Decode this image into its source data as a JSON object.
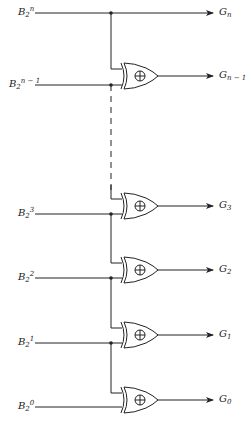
{
  "diagram": {
    "type": "binary-to-gray-code-converter",
    "line_color": "#222222",
    "inputs": [
      {
        "base": "B",
        "sub": "2",
        "sup": "n",
        "y": 13
      },
      {
        "base": "B",
        "sub": "2",
        "sup": "n − 1",
        "y": 85
      },
      {
        "base": "B",
        "sub": "2",
        "sup": "3",
        "y": 214
      },
      {
        "base": "B",
        "sub": "2",
        "sup": "2",
        "y": 278
      },
      {
        "base": "B",
        "sub": "2",
        "sup": "1",
        "y": 343
      },
      {
        "base": "B",
        "sub": "2",
        "sup": "0",
        "y": 407
      }
    ],
    "outputs": [
      {
        "base": "G",
        "sub": "n",
        "y": 13
      },
      {
        "base": "G",
        "sub": "n − 1",
        "y": 76
      },
      {
        "base": "G",
        "sub": "3",
        "y": 206
      },
      {
        "base": "G",
        "sub": "2",
        "y": 270
      },
      {
        "base": "G",
        "sub": "1",
        "y": 335
      },
      {
        "base": "G",
        "sub": "0",
        "y": 400
      }
    ],
    "gate_symbol": "⊕",
    "gate_type": "XOR",
    "gap_indicator": "dashed-line"
  }
}
